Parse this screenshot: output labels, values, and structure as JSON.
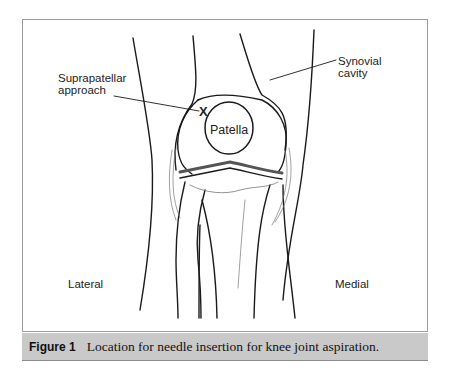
{
  "figure": {
    "labels": {
      "suprapatellar_line1": "Suprapatellar",
      "suprapatellar_line2": "approach",
      "synovial_line1": "Synovial",
      "synovial_line2": "cavity",
      "patella": "Patella",
      "lateral": "Lateral",
      "medial": "Medial",
      "insertion_marker": "X"
    },
    "caption": {
      "label": "Figure 1",
      "text": "Location for needle insertion for knee joint aspiration."
    },
    "colors": {
      "caption_bar": "#c9c9c9",
      "line": "#1a1a1a",
      "border": "#9a9a9a"
    }
  }
}
